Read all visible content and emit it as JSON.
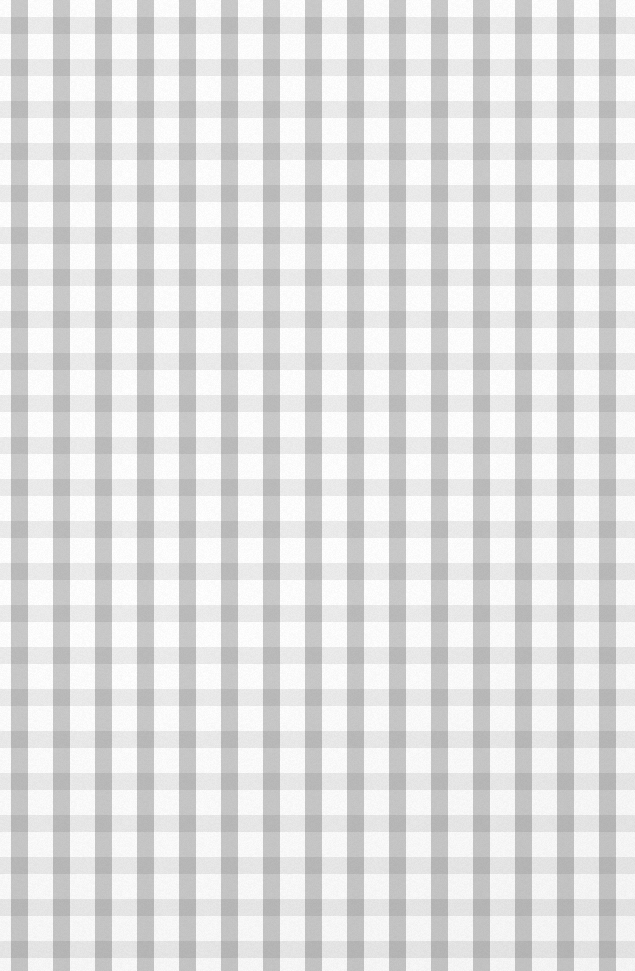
{
  "image": {
    "kind": "gingham-check-pattern",
    "description": "Seamless gingham / checkered plaid texture filling the entire frame",
    "width_px": 635,
    "height_px": 971,
    "orientation": "portrait"
  },
  "palette": {
    "background": "#ffffff",
    "stripe_light": "#dcdcdc",
    "stripe_dark": "#8a8a8a",
    "stripe_ink": "#9a9a9a",
    "grain": "#808080"
  },
  "pattern": {
    "type": "gingham",
    "tile_px": 42,
    "vertical": {
      "band_width_px": 17,
      "gap_px": 25,
      "phase_offset_px": 11,
      "alpha": 0.46,
      "color": "#8d8d8d",
      "count_visible": 16
    },
    "horizontal": {
      "band_width_px": 17,
      "gap_px": 25,
      "phase_offset_px": 59,
      "alpha": 0.155,
      "color": "#8d8d8d",
      "count_visible": 23
    },
    "tones": {
      "white_cell": "#ffffff",
      "single_overlap": "#dcdcdc",
      "double_overlap": "#8a8a8a"
    }
  },
  "labels": {
    "title": "",
    "caption": ""
  }
}
